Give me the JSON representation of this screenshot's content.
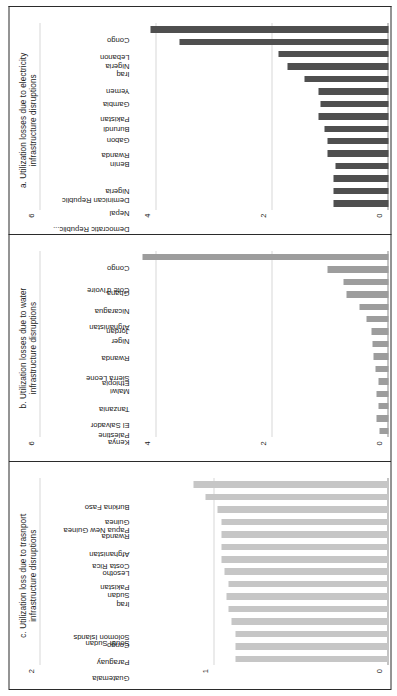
{
  "figure": {
    "background": "#ffffff",
    "panel_border_color": "#2b2b2b",
    "gridline_color": "#d7d7d7",
    "baseline_color": "#8a8a8a"
  },
  "chart_data": [
    {
      "id": "panel-c-transport",
      "type": "bar",
      "title": "c. Utilization loss due to trasnport infrastructure disruptions",
      "title_line1": "c. Utilization loss due to trasnport",
      "title_line2": "infrastructure disruptions",
      "xlabel": "",
      "ylabel": "",
      "ylim": [
        0,
        2
      ],
      "yticks": [
        0,
        1,
        2
      ],
      "ytick_labels": [
        "0",
        "1",
        "2"
      ],
      "grid": true,
      "legend": "none",
      "bar_color": "#c6c6c6",
      "categories": [
        "Guatemala",
        "Paraguay",
        "Congo",
        "South Sudan",
        "Solomon Islands",
        "Iraq",
        "Sudan",
        "Pakistan",
        "Lesotho",
        "Costa Rica",
        "Afghanistan",
        "Rwanda",
        "Guinea",
        "Papua New Guinea",
        "Burkina Faso"
      ],
      "values": [
        0.88,
        0.88,
        0.88,
        0.9,
        0.92,
        0.93,
        0.92,
        0.94,
        0.96,
        0.96,
        0.96,
        0.96,
        0.98,
        1.05,
        1.12
      ]
    },
    {
      "id": "panel-b-water",
      "type": "bar",
      "title": "b. Utilization losses due to water infrastructure disruptions",
      "title_line1": "b. Utilization losses due to water",
      "title_line2": "infrastructure disruptions",
      "xlabel": "",
      "ylabel": "",
      "ylim": [
        0,
        6
      ],
      "yticks": [
        0,
        2,
        4,
        6
      ],
      "ytick_labels": [
        "0",
        "2",
        "4",
        "6"
      ],
      "grid": true,
      "legend": "none",
      "bar_color": "#9d9d9d",
      "categories": [
        "Kenya",
        "Palestine",
        "El Salvador",
        "Tanzania",
        "Malwi",
        "Ethiopia",
        "Sierra Leone",
        "Rwanda",
        "Niger",
        "Jordan",
        "Afghanistan",
        "Nicaragua",
        "Ghana",
        "Cote d'Ivoire",
        "Congo"
      ],
      "values": [
        0.15,
        0.2,
        0.18,
        0.2,
        0.18,
        0.22,
        0.26,
        0.28,
        0.3,
        0.38,
        0.5,
        0.72,
        0.78,
        1.05,
        4.25
      ]
    },
    {
      "id": "panel-a-electricity",
      "type": "bar",
      "title": "a. Utilization losses due to electricity infrastructure disruptions",
      "title_line1": "a. Utilization losses due to electricity",
      "title_line2": "infrastructure disruptions",
      "xlabel": "",
      "ylabel": "",
      "ylim": [
        0,
        6
      ],
      "yticks": [
        0,
        2,
        4,
        6
      ],
      "ytick_labels": [
        "0",
        "2",
        "4",
        "6"
      ],
      "grid": true,
      "legend": "none",
      "bar_color": "#4f4f4f",
      "categories": [
        "Nepal",
        "Democratic Republic...",
        "Nigeria",
        "Deminican Republic",
        "Benin",
        "Rwanda",
        "Gabon",
        "Burundi",
        "Pakistan",
        "Gambia",
        "Yemen",
        "Iraq",
        "Nigeria",
        "Lebanon",
        "Congo"
      ],
      "values": [
        0.95,
        0.95,
        0.95,
        0.92,
        1.05,
        1.05,
        1.1,
        1.2,
        1.18,
        1.2,
        1.45,
        1.75,
        1.9,
        3.6,
        4.1
      ]
    }
  ]
}
